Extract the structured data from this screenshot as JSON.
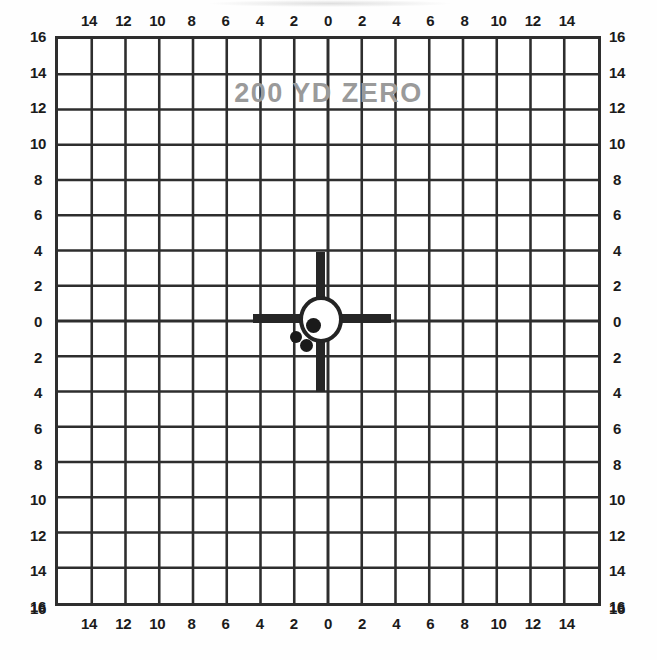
{
  "target": {
    "title_overlay": "200 YD ZERO",
    "grid": {
      "columns": 16,
      "rows": 16,
      "line_color": "#2e2e2e",
      "background_color": "#ffffff",
      "border_color": "#2e2e2e"
    },
    "axis": {
      "corner_label": "16",
      "top_labels": [
        "14",
        "12",
        "10",
        "8",
        "6",
        "4",
        "2",
        "0",
        "2",
        "4",
        "6",
        "8",
        "10",
        "12",
        "14"
      ],
      "bottom_labels": [
        "14",
        "12",
        "10",
        "8",
        "6",
        "4",
        "2",
        "0",
        "2",
        "4",
        "6",
        "8",
        "10",
        "12",
        "14"
      ],
      "left_labels": [
        "16",
        "14",
        "12",
        "10",
        "8",
        "6",
        "4",
        "2",
        "0",
        "2",
        "4",
        "6",
        "8",
        "10",
        "12",
        "14",
        "16"
      ],
      "right_labels": [
        "16",
        "14",
        "12",
        "10",
        "8",
        "6",
        "4",
        "2",
        "0",
        "2",
        "4",
        "6",
        "8",
        "10",
        "12",
        "14",
        "16"
      ]
    },
    "aim_point": {
      "circle_color": "#242424",
      "circle_fill": "#ffffff",
      "crosshair_color": "#262626"
    },
    "shots": [
      {
        "id": "shot-1",
        "left": 63,
        "top": 76,
        "size": 15
      },
      {
        "id": "shot-2",
        "left": 47,
        "top": 89,
        "size": 12
      },
      {
        "id": "shot-3",
        "left": 57,
        "top": 97,
        "size": 13
      }
    ],
    "overlay_color": "#9a9a9a"
  }
}
